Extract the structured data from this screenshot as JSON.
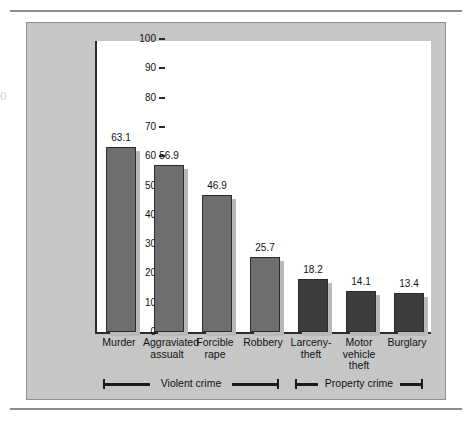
{
  "chart_data": {
    "type": "bar",
    "title": "",
    "subtitle": "",
    "xlabel": "",
    "ylabel": "",
    "ylim": [
      0,
      100
    ],
    "ytick_labels": [
      "100",
      "90",
      "80",
      "70",
      "60",
      "50",
      "40",
      "30",
      "20",
      "10",
      "0"
    ],
    "ytick_values": [
      100,
      90,
      80,
      70,
      60,
      50,
      40,
      30,
      20,
      10,
      0
    ],
    "grid": false,
    "legend_position": "none",
    "categories": [
      "Murder",
      "Aggraviated\nassualt",
      "Forcible\nrape",
      "Robbery",
      "Larceny-\ntheft",
      "Motor\nvehicle\ntheft",
      "Burglary"
    ],
    "values": [
      63.1,
      56.9,
      46.9,
      25.7,
      18.2,
      14.1,
      13.4
    ],
    "value_labels": [
      "63.1",
      "56.9",
      "46.9",
      "25.7",
      "18.2",
      "14.1",
      "13.4"
    ],
    "groups": [
      {
        "label": "Violent crime",
        "categories": [
          "Murder",
          "Aggraviated assualt",
          "Forcible rape",
          "Robbery"
        ],
        "bar_color": "#6e6e6e"
      },
      {
        "label": "Property crime",
        "categories": [
          "Larceny-theft",
          "Motor vehicle theft",
          "Burglary"
        ],
        "bar_color": "#3d3d3d"
      }
    ],
    "colors": {
      "violent_bar": "#6e6e6e",
      "property_bar": "#3d3d3d",
      "bar_outline": "#2b2b2b",
      "bar_shadow": "#b9b9b9",
      "panel_background": "#c6c6c6",
      "plot_background": "#ffffff",
      "axis": "#2b2b2b",
      "text": "#111111"
    }
  },
  "artifact": {
    "glyph": "0"
  }
}
